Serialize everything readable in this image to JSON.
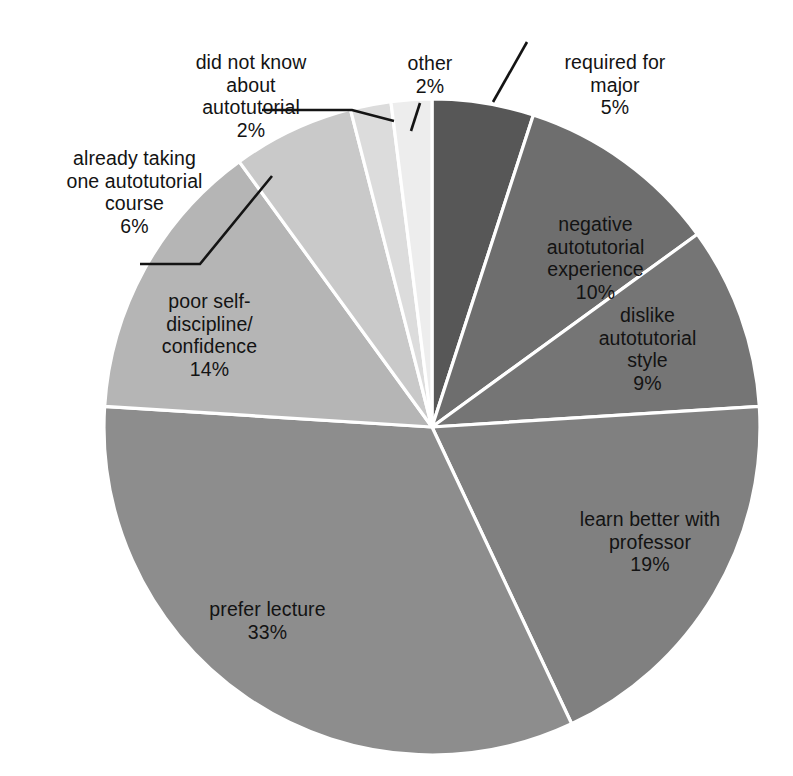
{
  "chart_data": {
    "type": "pie",
    "title": "",
    "subtitle": "",
    "xlabel": "",
    "ylabel": "",
    "legend_position": "none",
    "grid": false,
    "units": "percent",
    "total": 100,
    "start_angle_deg": 0,
    "direction": "clockwise",
    "categories": [
      "required for major",
      "negative autotutorial experience",
      "dislike autotutorial style",
      "learn better with professor",
      "prefer lecture",
      "poor self-discipline/confidence",
      "already taking one autotutorial course",
      "did not know about autotutorial",
      "other"
    ],
    "values": [
      5,
      10,
      9,
      19,
      33,
      14,
      6,
      2,
      2
    ],
    "slices": [
      {
        "id": "required-for-major",
        "label": "required for\nmajor",
        "value": 5,
        "pct_text": "5%",
        "color": "#575757",
        "label_placement": "outside",
        "leader": true
      },
      {
        "id": "negative-autotutorial-experience",
        "label": "negative\nautotutorial\nexperience",
        "value": 10,
        "pct_text": "10%",
        "color": "#6e6e6e",
        "label_placement": "inside",
        "leader": false
      },
      {
        "id": "dislike-autotutorial-style",
        "label": "dislike\nautotutorial\nstyle",
        "value": 9,
        "pct_text": "9%",
        "color": "#757575",
        "label_placement": "inside",
        "leader": false
      },
      {
        "id": "learn-better-with-professor",
        "label": "learn better with\nprofessor",
        "value": 19,
        "pct_text": "19%",
        "color": "#808080",
        "label_placement": "inside",
        "leader": false
      },
      {
        "id": "prefer-lecture",
        "label": "prefer lecture",
        "value": 33,
        "pct_text": "33%",
        "color": "#8d8d8d",
        "label_placement": "inside",
        "leader": false
      },
      {
        "id": "poor-self-discipline-confidence",
        "label": "poor self-\ndiscipline/\nconfidence",
        "value": 14,
        "pct_text": "14%",
        "color": "#b5b5b5",
        "label_placement": "inside",
        "leader": false
      },
      {
        "id": "already-taking-one-autotutorial-course",
        "label": "already taking\none autotutorial\ncourse",
        "value": 6,
        "pct_text": "6%",
        "color": "#c9c9c9",
        "label_placement": "outside",
        "leader": true
      },
      {
        "id": "did-not-know-about-autotutorial",
        "label": "did not know\nabout\nautotutorial",
        "value": 2,
        "pct_text": "2%",
        "color": "#dcdcdc",
        "label_placement": "outside",
        "leader": true
      },
      {
        "id": "other",
        "label": "other",
        "value": 2,
        "pct_text": "2%",
        "color": "#ededed",
        "label_placement": "outside",
        "leader": true
      }
    ],
    "geometry": {
      "center_x": 432,
      "center_y": 427,
      "radius": 328,
      "slice_border_color": "#ffffff",
      "background_color": "#ffffff",
      "label_color": "#131313",
      "leader_color": "#141414"
    }
  }
}
